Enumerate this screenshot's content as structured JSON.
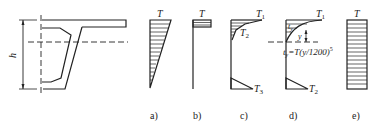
{
  "figure": {
    "cross_section": {
      "dimension_label": "h"
    },
    "panels": [
      {
        "id": "a",
        "caption": "a)",
        "top_label": "T"
      },
      {
        "id": "b",
        "caption": "b)",
        "top_label": "T"
      },
      {
        "id": "c",
        "caption": "c)",
        "top_label": "T",
        "top_sub": "1",
        "mid_label": "T",
        "mid_sub": "2",
        "bottom_label": "T",
        "bottom_sub": "3"
      },
      {
        "id": "d",
        "caption": "d)",
        "top_label": "T",
        "top_sub": "1",
        "inner_label": "t",
        "inner_sub": "y",
        "y_label": "y",
        "formula_prefix": "t",
        "formula_sub": "y",
        "formula_body": "=T(y/1200)",
        "formula_exp": "5",
        "bottom_label": "T",
        "bottom_sub": "2"
      },
      {
        "id": "e",
        "caption": "e)",
        "top_label": "T"
      }
    ]
  }
}
